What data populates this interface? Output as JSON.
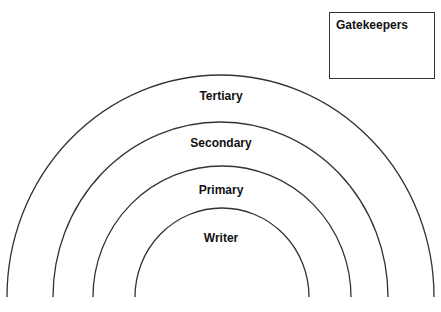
{
  "diagram": {
    "rings": [
      {
        "label": "Tertiary",
        "cx": 220.5,
        "rx": 213.5,
        "top": 75
      },
      {
        "label": "Secondary",
        "cx": 220.5,
        "rx": 167.5,
        "top": 122
      },
      {
        "label": "Primary",
        "cx": 222,
        "rx": 129,
        "top": 166
      },
      {
        "label": "Writer",
        "cx": 222,
        "rx": 87,
        "top": 208
      }
    ],
    "gatekeepers_label": "Gatekeepers",
    "stroke_color": "#333333"
  }
}
